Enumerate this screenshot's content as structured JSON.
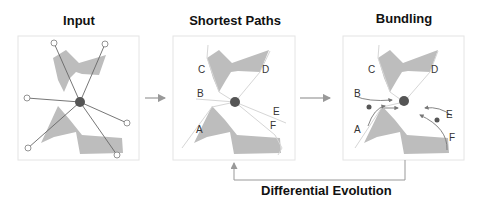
{
  "panels": [
    {
      "id": "input",
      "title": "Input"
    },
    {
      "id": "shortest-paths",
      "title": "Shortest Paths",
      "labels": [
        "A",
        "B",
        "C",
        "D",
        "E",
        "F"
      ]
    },
    {
      "id": "bundling",
      "title": "Bundling",
      "labels": [
        "A",
        "B",
        "C",
        "D",
        "E",
        "F"
      ]
    }
  ],
  "feedback": {
    "label": "Differential Evolution"
  },
  "colors": {
    "obstacle": "#bdbdbd",
    "node": "#555555",
    "edge": "#666666",
    "path": "#d9d9d9",
    "frame": "#e6e6e6",
    "arrow": "#999999"
  }
}
